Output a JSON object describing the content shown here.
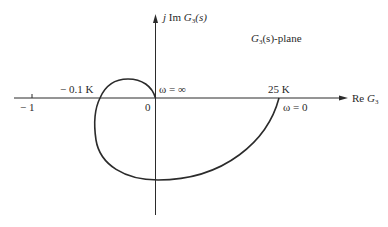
{
  "diagram": {
    "title": "G3(s)-plane",
    "plane_label": {
      "prefix": "G",
      "sub": "3",
      "suffix": "(s)-plane"
    },
    "axes": {
      "imag_label": {
        "j": "j",
        "im": " Im ",
        "G": "G",
        "sub": "3",
        "arg": "(s)"
      },
      "real_label": {
        "re": "Re ",
        "G": "G",
        "sub": "3"
      }
    },
    "tick_labels": {
      "minus_one": "− 1",
      "origin": "0",
      "neg_crossing": "− 0.1 K",
      "pos_crossing": "25 K"
    },
    "annotations": {
      "omega_inf": "ω = ∞",
      "omega_zero": "ω = 0"
    },
    "colors": {
      "line": "#2b2b2b",
      "background": "#ffffff"
    }
  }
}
